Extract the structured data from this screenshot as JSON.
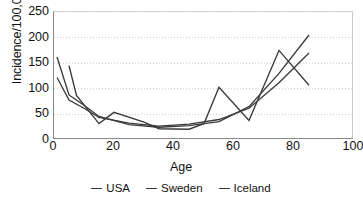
{
  "chart_data": {
    "type": "line",
    "title": "",
    "xlabel": "Age",
    "ylabel": "Incidence/100,000",
    "xlim": [
      0,
      100
    ],
    "ylim": [
      0,
      250
    ],
    "xticks": [
      0,
      20,
      40,
      60,
      80,
      100
    ],
    "yticks": [
      0,
      50,
      100,
      150,
      200,
      250
    ],
    "grid": "horizontal-dotted",
    "legend_position": "bottom-center",
    "line_color": "#3a3a3a",
    "series": [
      {
        "name": "USA",
        "x": [
          1,
          5,
          10,
          15,
          25,
          35,
          45,
          55,
          65,
          75,
          85
        ],
        "values": [
          122,
          78,
          62,
          44,
          33,
          27,
          31,
          40,
          62,
          112,
          170
        ]
      },
      {
        "name": "Sweden",
        "x": [
          1,
          5,
          10,
          15,
          25,
          35,
          45,
          55,
          65,
          75,
          85
        ],
        "values": [
          162,
          88,
          68,
          46,
          30,
          25,
          28,
          36,
          65,
          130,
          205
        ]
      },
      {
        "name": "Iceland",
        "x": [
          5,
          7.5,
          15,
          20,
          30,
          35,
          45,
          50,
          55,
          65,
          75,
          85
        ],
        "values": [
          145,
          87,
          32,
          54,
          35,
          22,
          21,
          32,
          103,
          38,
          175,
          107
        ]
      }
    ]
  },
  "axis": {
    "y_label": "Incidence/100,000",
    "x_label": "Age",
    "y_tick_labels": [
      "250",
      "200",
      "150",
      "100",
      "50",
      "0"
    ],
    "x_tick_labels": [
      "0",
      "20",
      "40",
      "60",
      "80",
      "100"
    ]
  },
  "legend": {
    "items": [
      {
        "label": "USA"
      },
      {
        "label": "Sweden"
      },
      {
        "label": "Iceland"
      }
    ]
  }
}
